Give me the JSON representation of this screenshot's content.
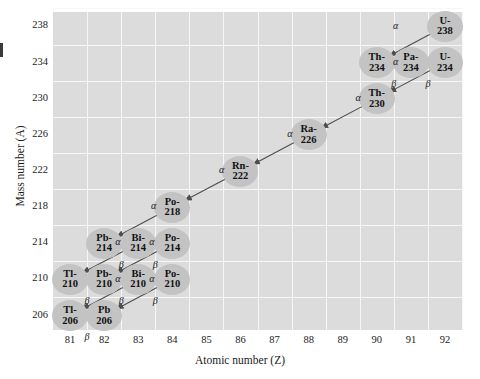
{
  "figure": {
    "type": "decay-chain-diagram"
  },
  "axes": {
    "xlabel": "Atomic number (Z)",
    "ylabel": "Mass number (A)",
    "xticks": [
      81,
      82,
      83,
      84,
      85,
      86,
      87,
      88,
      89,
      90,
      91,
      92
    ],
    "yticks": [
      206,
      210,
      214,
      218,
      222,
      226,
      230,
      234,
      238
    ],
    "xlim": [
      80.5,
      92.5
    ],
    "ylim": [
      204.4,
      239.6
    ],
    "grid": true,
    "plot_background": "#dcdcdc",
    "gridline_color": "#f7f7f7"
  },
  "chart_data": {
    "type": "scatter",
    "xlabel": "Atomic number (Z)",
    "ylabel": "Mass number (A)",
    "xlim": [
      80.5,
      92.5
    ],
    "ylim": [
      204.4,
      239.6
    ],
    "grid": true,
    "node_color": "#c3c3c3",
    "arrow_color": "#4d4d4d",
    "nodes": [
      {
        "id": "U-238",
        "label_top": "U-",
        "label_bottom": "238",
        "z": 92,
        "a": 238
      },
      {
        "id": "Th-234",
        "label_top": "Th-",
        "label_bottom": "234",
        "z": 90,
        "a": 234
      },
      {
        "id": "Pa-234",
        "label_top": "Pa-",
        "label_bottom": "234",
        "z": 91,
        "a": 234
      },
      {
        "id": "U-234",
        "label_top": "U-",
        "label_bottom": "234",
        "z": 92,
        "a": 234
      },
      {
        "id": "Th-230",
        "label_top": "Th-",
        "label_bottom": "230",
        "z": 90,
        "a": 230
      },
      {
        "id": "Ra-226",
        "label_top": "Ra-",
        "label_bottom": "226",
        "z": 88,
        "a": 226
      },
      {
        "id": "Rn-222",
        "label_top": "Rn-",
        "label_bottom": "222",
        "z": 86,
        "a": 222
      },
      {
        "id": "Po-218",
        "label_top": "Po-",
        "label_bottom": "218",
        "z": 84,
        "a": 218
      },
      {
        "id": "Pb-214",
        "label_top": "Pb-",
        "label_bottom": "214",
        "z": 82,
        "a": 214
      },
      {
        "id": "Bi-214",
        "label_top": "Bi-",
        "label_bottom": "214",
        "z": 83,
        "a": 214
      },
      {
        "id": "Po-214",
        "label_top": "Po-",
        "label_bottom": "214",
        "z": 84,
        "a": 214
      },
      {
        "id": "Tl-210",
        "label_top": "Tl-",
        "label_bottom": "210",
        "z": 81,
        "a": 210
      },
      {
        "id": "Pb-210",
        "label_top": "Pb-",
        "label_bottom": "210",
        "z": 82,
        "a": 210
      },
      {
        "id": "Bi-210",
        "label_top": "Bi-",
        "label_bottom": "210",
        "z": 83,
        "a": 210
      },
      {
        "id": "Po-210",
        "label_top": "Po-",
        "label_bottom": "210",
        "z": 84,
        "a": 210
      },
      {
        "id": "Tl-206",
        "label_top": "Tl-",
        "label_bottom": "206",
        "z": 81,
        "a": 206
      },
      {
        "id": "Pb-206",
        "label_top": "Pb",
        "label_bottom": "206",
        "z": 82,
        "a": 206
      }
    ],
    "decays": [
      {
        "from": "U-238",
        "to": "Th-234",
        "mode": "α",
        "label_dx": -0.45,
        "label_dy": 1.1
      },
      {
        "from": "Th-234",
        "to": "Pa-234",
        "mode": "β",
        "label_dx": 0.0,
        "label_dy": -1.15,
        "reverse_arrow": true
      },
      {
        "from": "U-234",
        "to": "Pa-234",
        "mode": "β",
        "label_dx": 0.0,
        "label_dy": -1.15
      },
      {
        "from": "U-234",
        "to": "Th-230",
        "mode": "α",
        "label_dx": -0.45,
        "label_dy": 1.1
      },
      {
        "from": "Th-230",
        "to": "Ra-226",
        "mode": "α",
        "label_dx": 0.45,
        "label_dy": 1.1
      },
      {
        "from": "Ra-226",
        "to": "Rn-222",
        "mode": "α",
        "label_dx": 0.45,
        "label_dy": 1.1
      },
      {
        "from": "Rn-222",
        "to": "Po-218",
        "mode": "α",
        "label_dx": 0.45,
        "label_dy": 1.1
      },
      {
        "from": "Po-218",
        "to": "Pb-214",
        "mode": "α",
        "label_dx": 0.45,
        "label_dy": 1.1
      },
      {
        "from": "Bi-214",
        "to": "Pb-214",
        "mode": "β",
        "label_dx": 0.0,
        "label_dy": -1.15
      },
      {
        "from": "Po-214",
        "to": "Bi-214",
        "mode": "β",
        "label_dx": 0.0,
        "label_dy": -1.15
      },
      {
        "from": "Bi-214",
        "to": "Tl-210",
        "mode": "α",
        "label_dx": 0.4,
        "label_dy": 1.1
      },
      {
        "from": "Po-214",
        "to": "Pb-210",
        "mode": "α",
        "label_dx": 0.4,
        "label_dy": 1.1
      },
      {
        "from": "Tl-210",
        "to": "Pb-210",
        "mode": "β",
        "label_dx": 0.0,
        "label_dy": -1.15
      },
      {
        "from": "Bi-210",
        "to": "Pb-210",
        "mode": "β",
        "label_dx": 0.0,
        "label_dy": -1.15
      },
      {
        "from": "Po-210",
        "to": "Bi-210",
        "mode": "β",
        "label_dx": 0.0,
        "label_dy": -1.15
      },
      {
        "from": "Bi-210",
        "to": "Tl-206",
        "mode": "α",
        "label_dx": 0.4,
        "label_dy": 1.1
      },
      {
        "from": "Po-210",
        "to": "Pb-206",
        "mode": "α",
        "label_dx": 0.4,
        "label_dy": 1.1
      },
      {
        "from": "Tl-206",
        "to": "Pb-206",
        "mode": "β",
        "label_dx": 0.0,
        "label_dy": -1.15
      }
    ]
  }
}
